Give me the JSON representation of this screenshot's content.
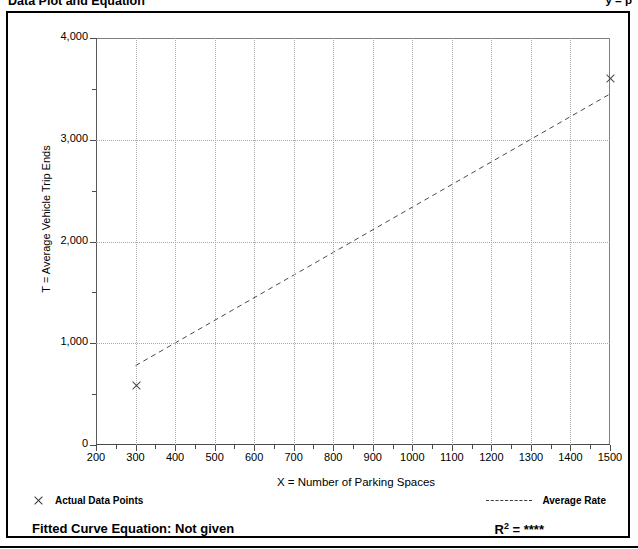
{
  "header": {
    "title": "Data Plot and Equation",
    "right_note": "y  =  p"
  },
  "chart_data": {
    "type": "scatter",
    "title": "Data Plot and Equation",
    "xlabel": "X = Number of Parking Spaces",
    "ylabel": "T = Average Vehicle Trip Ends",
    "xlim": [
      200,
      1500
    ],
    "ylim": [
      0,
      4000
    ],
    "grid": true,
    "x_ticks": [
      200,
      300,
      400,
      500,
      600,
      700,
      800,
      900,
      1000,
      1100,
      1200,
      1300,
      1400,
      1500
    ],
    "x_tick_labels": [
      "200",
      "300",
      "400",
      "500",
      "600",
      "700",
      "800",
      "900",
      "1000",
      "1100",
      "1200",
      "1300",
      "1400",
      "1500"
    ],
    "y_ticks": [
      0,
      1000,
      2000,
      3000,
      4000
    ],
    "y_tick_labels": [
      "0",
      "1,000",
      "2,000",
      "3,000",
      "4,000"
    ],
    "y_minor_ticks": [
      500,
      1500,
      2500,
      3500
    ],
    "series": [
      {
        "name": "Actual Data Points",
        "type": "scatter",
        "marker": "x",
        "points": [
          {
            "x": 300,
            "y": 580
          },
          {
            "x": 1500,
            "y": 3600
          }
        ]
      },
      {
        "name": "Average Rate",
        "type": "line",
        "style": "dashed",
        "points": [
          {
            "x": 300,
            "y": 780
          },
          {
            "x": 1500,
            "y": 3450
          }
        ]
      }
    ],
    "legend_position": "below-axes",
    "annotations": {
      "fitted_curve_label": "Fitted Curve Equation:",
      "fitted_curve_value": "Not given",
      "r_squared_label": "R",
      "r_squared_exponent": "2",
      "r_squared_equals": "= ",
      "r_squared_value": "****"
    }
  },
  "legend": {
    "data_points_label": "Actual Data Points",
    "average_rate_label": "Average Rate"
  }
}
